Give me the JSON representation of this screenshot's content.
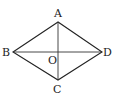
{
  "diagram": {
    "type": "geometry",
    "shape": "rhombus",
    "points": {
      "A": {
        "label": "A",
        "x": 58,
        "y": 22
      },
      "B": {
        "label": "B",
        "x": 13,
        "y": 52
      },
      "C": {
        "label": "C",
        "x": 58,
        "y": 80
      },
      "D": {
        "label": "D",
        "x": 102,
        "y": 52
      },
      "O": {
        "label": "O",
        "x": 58,
        "y": 52
      }
    },
    "edges": [
      [
        "A",
        "B"
      ],
      [
        "B",
        "C"
      ],
      [
        "C",
        "D"
      ],
      [
        "D",
        "A"
      ]
    ],
    "diagonals": [
      [
        "A",
        "C"
      ],
      [
        "B",
        "D"
      ]
    ],
    "colors": {
      "stroke": "#222222",
      "background": "#ffffff"
    }
  }
}
